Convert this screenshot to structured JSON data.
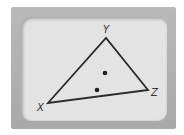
{
  "diagram": {
    "type": "triangle",
    "vertices": [
      {
        "label": "X",
        "x": 48,
        "y": 103,
        "lx": 37,
        "ly": 111
      },
      {
        "label": "Y",
        "x": 106,
        "y": 38,
        "lx": 103,
        "ly": 33
      },
      {
        "label": "Z",
        "x": 148,
        "y": 90,
        "lx": 151,
        "ly": 96
      }
    ],
    "points": [
      {
        "x": 105,
        "y": 73
      },
      {
        "x": 97,
        "y": 90
      }
    ],
    "stroke_color": "#2a2a2a",
    "point_color": "#222222"
  },
  "labels": {
    "x": "X",
    "y": "Y",
    "z": "Z"
  }
}
